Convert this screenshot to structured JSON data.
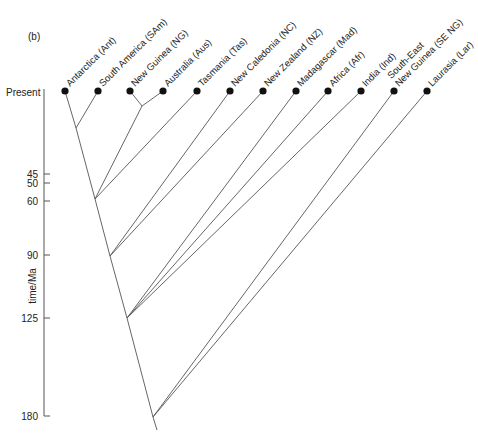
{
  "panel_label": "(b)",
  "axis": {
    "label": "time/Ma",
    "present_label": "Present",
    "ticks": [
      {
        "label": "45",
        "value": 45,
        "y": 174
      },
      {
        "label": "50",
        "value": 50,
        "y": 183
      },
      {
        "label": "60",
        "value": 60,
        "y": 201
      },
      {
        "label": "90",
        "value": 90,
        "y": 255
      },
      {
        "label": "125",
        "value": 125,
        "y": 318
      },
      {
        "label": "180",
        "value": 180,
        "y": 416
      }
    ]
  },
  "taxa": [
    {
      "id": "Ant",
      "label": "Antarctica (Ant)",
      "x": 65
    },
    {
      "id": "SAm",
      "label": "South America (SAm)",
      "x": 98
    },
    {
      "id": "NG",
      "label": "New Guinea (NG)",
      "x": 130
    },
    {
      "id": "Aus",
      "label": "Australia (Aus)",
      "x": 163
    },
    {
      "id": "Tas",
      "label": "Tasmania (Tas)",
      "x": 197
    },
    {
      "id": "NC",
      "label": "New Caledonia (NC)",
      "x": 230
    },
    {
      "id": "NZ",
      "label": "New Zealand (NZ)",
      "x": 263
    },
    {
      "id": "Mad",
      "label": "Madagascar (Mad)",
      "x": 296
    },
    {
      "id": "Afr",
      "label": "Africa (Afr)",
      "x": 328
    },
    {
      "id": "Ind",
      "label": "India (Ind)",
      "x": 361
    },
    {
      "id": "SENG",
      "label": "South-East|New Guinea (SE NG)",
      "x": 394
    },
    {
      "id": "Lar",
      "label": "Laurasia (Lar)",
      "x": 427
    }
  ],
  "tree": {
    "tip_y": 91,
    "nodes": [
      {
        "id": "n_ant_sam",
        "x": 76,
        "y": 128,
        "children": [
          "Ant",
          "SAm"
        ]
      },
      {
        "id": "n_ng_aus",
        "x": 142,
        "y": 106,
        "children": [
          "NG",
          "Aus"
        ]
      },
      {
        "id": "n_60",
        "x": 95,
        "y": 199,
        "children": [
          "n_ant_sam",
          "n_ng_aus",
          "Tas"
        ],
        "age_ma": 60
      },
      {
        "id": "n_90",
        "x": 110,
        "y": 256,
        "children": [
          "n_60",
          "NC",
          "NZ"
        ],
        "age_ma": 90
      },
      {
        "id": "n_125",
        "x": 127,
        "y": 318,
        "children": [
          "n_90",
          "Mad",
          "Afr",
          "Ind"
        ],
        "age_ma": 125
      },
      {
        "id": "root",
        "x": 153,
        "y": 417,
        "children": [
          "n_125",
          "SENG",
          "Lar"
        ],
        "age_ma": 180
      }
    ],
    "root_stem_end": {
      "x": 157,
      "y": 430
    }
  },
  "colors": {
    "line": "#555555",
    "dot": "#111111",
    "text": "#222222"
  }
}
